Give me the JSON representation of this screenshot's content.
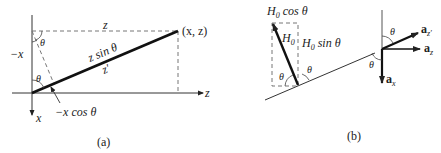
{
  "panel_a": {
    "caption": "(a)",
    "labels": {
      "z_top": "z",
      "point": "(x, z)",
      "neg_x": "−x",
      "theta_top": "θ",
      "theta_origin": "θ",
      "z_sin_theta": "z sin θ",
      "z_prime": "z′",
      "neg_x_cos_theta": "−x cos θ",
      "x_axis": "x",
      "z_axis": "z"
    }
  },
  "panel_b": {
    "caption": "(b)",
    "labels": {
      "h0_cos_theta_H": "H",
      "h0_cos_theta_sub": "0",
      "h0_cos_theta_rest": " cos θ",
      "h0_H": "H",
      "h0_sub": "0",
      "h0_sin_theta_H": "H",
      "h0_sin_theta_sub": "0",
      "h0_sin_theta_rest": " sin θ",
      "theta_inner": "θ",
      "theta_outer": "θ",
      "theta_top_right": "θ",
      "theta_bottom_right": "θ",
      "a_zprime": "a",
      "a_zprime_sub": "z′",
      "a_z": "a",
      "a_z_sub": "z",
      "a_x": "a",
      "a_x_sub": "x"
    }
  },
  "colors": {
    "line": "#222222",
    "dash": "#777777"
  }
}
